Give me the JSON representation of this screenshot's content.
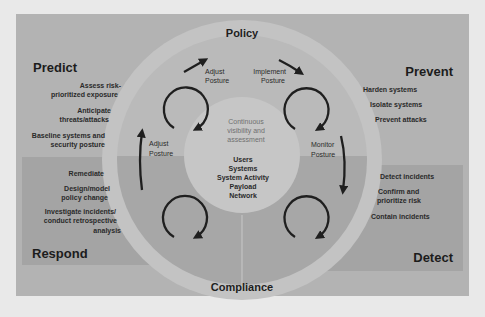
{
  "diagram": {
    "ring": {
      "top_label": "Policy",
      "bottom_label": "Compliance"
    },
    "core": {
      "heading_lines": [
        "Continuous",
        "visibility and",
        "assessment"
      ],
      "items": [
        "Users",
        "Systems",
        "System Activity",
        "Payload",
        "Network"
      ]
    },
    "steps": {
      "top_left": [
        "Adjust",
        "Posture"
      ],
      "top_right": [
        "Implement",
        "Posture"
      ],
      "right": [
        "Monitor",
        "Posture"
      ],
      "left": [
        "Adjust",
        "Posture"
      ]
    },
    "quadrants": {
      "predict": {
        "title": "Predict",
        "items": [
          [
            "Assess risk-",
            "prioritized exposure"
          ],
          [
            "Anticipate",
            "threats/attacks"
          ],
          [
            "Baseline systems and",
            "security posture"
          ]
        ]
      },
      "prevent": {
        "title": "Prevent",
        "items": [
          [
            "Harden systems"
          ],
          [
            "Isolate systems"
          ],
          [
            "Prevent attacks"
          ]
        ]
      },
      "respond": {
        "title": "Respond",
        "items": [
          [
            "Remediate"
          ],
          [
            "Design/model",
            "policy change"
          ],
          [
            "Investigate incidents/",
            "conduct retrospective",
            "analysis"
          ]
        ]
      },
      "detect": {
        "title": "Detect",
        "items": [
          [
            "Detect incidents"
          ],
          [
            "Confirm and",
            "prioritize risk"
          ],
          [
            "Contain incidents"
          ]
        ]
      }
    },
    "colors": {
      "page_bg": "#e9e9e9",
      "panel_top": "#b3b3b3",
      "panel_bottom": "#a4a4a4",
      "outer_ring": "#c3c3c3",
      "inner_disc_top": "#bababa",
      "inner_disc_bottom": "#a7a7a7",
      "core": "#c6c6c6",
      "arrow": "#1f1f1f"
    }
  }
}
